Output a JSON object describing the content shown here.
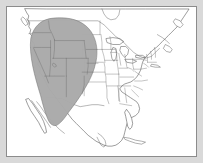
{
  "figure": {
    "type": "range-map",
    "width": 203,
    "height": 163,
    "background_color": "#d9d9d9",
    "map_background_color": "#ffffff",
    "frame_color": "#8c8c8c",
    "frame_inset_px": 6
  },
  "legend": {
    "shaded_region_label": "Shaded distribution range",
    "shaded_region_color": "#a9a9a9",
    "shaded_region_outline_color": "#6f6f6f",
    "coastline_color": "#4a4a4a",
    "state_boundary_color": "#6b6b6b",
    "country_boundary_color": "#5a5a5a"
  },
  "map": {
    "projection_hint": "conic",
    "extent_label": "North America — Canada, United States, Mexico, Caribbean",
    "features": {
      "coastlines_label": "Continental coastline",
      "great_lakes_label": "Great Lakes",
      "state_boundaries_label": "United States state boundaries",
      "country_boundaries_label": "International boundaries",
      "range_polygon_label": "Species range — western United States and northwestern Mexico"
    }
  },
  "chart_data": {
    "type": "map",
    "region": "North America",
    "shaded_area_description": "Contiguous shaded oval covering the western United States from the Canadian border south into northwestern Mexico",
    "states_shaded": [
      "Washington",
      "Oregon",
      "Idaho",
      "Montana",
      "Wyoming",
      "Nevada",
      "Utah",
      "Colorado",
      "Arizona",
      "New Mexico",
      "eastern California",
      "western Nebraska",
      "western Kansas",
      "western Texas",
      "northwestern Mexico"
    ],
    "states_unshaded": [
      "All eastern United States",
      "Eastern Canada",
      "Southern Mexico",
      "Florida",
      "Cuba"
    ],
    "legend_position": "none",
    "grid": false
  }
}
